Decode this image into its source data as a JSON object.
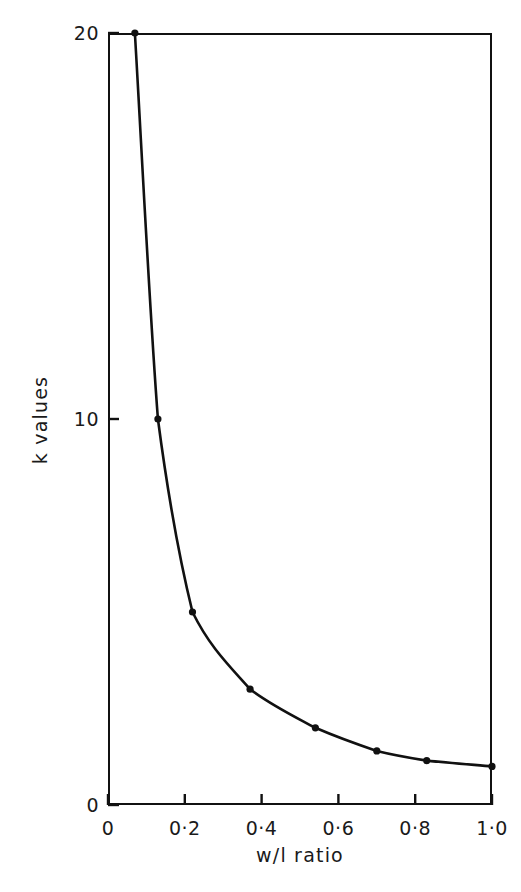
{
  "chart_data": {
    "type": "line",
    "title": "",
    "subtitle": "",
    "xlabel": "w/l ratio",
    "ylabel": "k values",
    "xlim": [
      0,
      1.0
    ],
    "ylim": [
      0,
      20
    ],
    "grid": false,
    "legend": null,
    "markers": "filled-circle",
    "line_color": "#111111",
    "marker_color": "#111111",
    "background_color": "#ffffff",
    "x_tick_labels": [
      "0",
      "0·2",
      "0·4",
      "0·6",
      "0·8",
      "1·0"
    ],
    "x_tick_values": [
      0,
      0.2,
      0.4,
      0.6,
      0.8,
      1.0
    ],
    "y_tick_labels": [
      "0",
      "10",
      "20"
    ],
    "y_tick_values": [
      0,
      10,
      20
    ],
    "series": [
      {
        "name": "k vs w/l ratio",
        "x": [
          0.07,
          0.13,
          0.22,
          0.37,
          0.54,
          0.7,
          0.83,
          1.0
        ],
        "y": [
          20.0,
          10.0,
          5.0,
          3.0,
          2.0,
          1.4,
          1.15,
          1.0
        ]
      }
    ],
    "annotations": []
  },
  "figure": {
    "axis_color": "#111111",
    "text_color": "#1a1a1a"
  }
}
